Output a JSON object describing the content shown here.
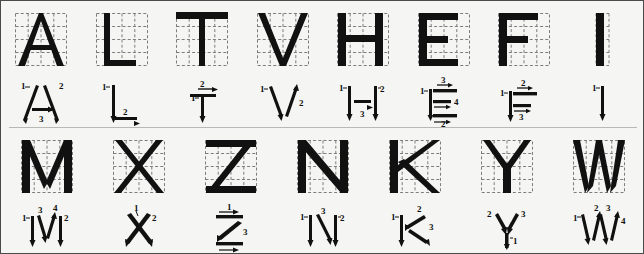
{
  "chart": {
    "background_color": "#f5f5f3",
    "ink_color": "#111111",
    "grid_color": "#7d7d7d",
    "border_color": "#4a4a4a",
    "grid": {
      "rows": 4,
      "cols": 4,
      "style": "dashed"
    },
    "rows": [
      {
        "name": "row-1",
        "cells": [
          {
            "letter": "A",
            "glyph": "A",
            "stroke_count": 3,
            "stroke_labels": [
              "1",
              "2",
              "3"
            ],
            "stroke_notes": "1 left diagonal down, 2 right diagonal down, 3 crossbar left to right"
          },
          {
            "letter": "L",
            "glyph": "L",
            "stroke_count": 2,
            "stroke_labels": [
              "1",
              "2"
            ],
            "stroke_notes": "1 vertical down, 2 horizontal left to right"
          },
          {
            "letter": "T",
            "glyph": "T",
            "stroke_count": 2,
            "stroke_labels": [
              "1",
              "2"
            ],
            "stroke_notes": "1 vertical down, 2 top horizontal left to right"
          },
          {
            "letter": "V",
            "glyph": "V",
            "stroke_count": 2,
            "stroke_labels": [
              "1",
              "2"
            ],
            "stroke_notes": "1 left diagonal down, 2 right diagonal up"
          },
          {
            "letter": "H",
            "glyph": "H",
            "stroke_count": 3,
            "stroke_labels": [
              "1",
              "2",
              "3"
            ],
            "stroke_notes": "1 left vertical down, 2 right vertical down, 3 crossbar left to right"
          },
          {
            "letter": "E",
            "glyph": "E",
            "stroke_count": 4,
            "stroke_labels": [
              "1",
              "2",
              "3",
              "4"
            ],
            "stroke_notes": "1 vertical down, 3 top horizontal, 4 middle horizontal, 2 bottom horizontal"
          },
          {
            "letter": "F",
            "glyph": "F",
            "stroke_count": 3,
            "stroke_labels": [
              "1",
              "2",
              "3"
            ],
            "stroke_notes": "1 vertical down, 2 top horizontal, 3 middle horizontal"
          },
          {
            "letter": "I",
            "glyph": "I",
            "stroke_count": 1,
            "stroke_labels": [
              "1"
            ],
            "stroke_notes": "1 vertical down"
          }
        ]
      },
      {
        "name": "row-2",
        "cells": [
          {
            "letter": "M",
            "glyph": "M",
            "stroke_count": 4,
            "stroke_labels": [
              "1",
              "2",
              "3",
              "4"
            ],
            "stroke_notes": "1 left vertical down, 2 right vertical down, 3 diagonal down, 4 diagonal up"
          },
          {
            "letter": "X",
            "glyph": "X",
            "stroke_count": 2,
            "stroke_labels": [
              "1",
              "2"
            ],
            "stroke_notes": "1 diagonal down-left, 2 diagonal down-right"
          },
          {
            "letter": "Z",
            "glyph": "Z",
            "stroke_count": 3,
            "stroke_labels": [
              "1",
              "2",
              "3"
            ],
            "stroke_notes": "1 top horizontal, 3 diagonal down-left, 2 bottom horizontal"
          },
          {
            "letter": "N",
            "glyph": "N",
            "stroke_count": 3,
            "stroke_labels": [
              "1",
              "2",
              "3"
            ],
            "stroke_notes": "1 left vertical down, 2 right vertical down, 3 diagonal down"
          },
          {
            "letter": "K",
            "glyph": "K",
            "stroke_count": 3,
            "stroke_labels": [
              "1",
              "2",
              "3"
            ],
            "stroke_notes": "1 vertical down, 2 upper diagonal inward, 3 lower diagonal outward"
          },
          {
            "letter": "Y",
            "glyph": "Y",
            "stroke_count": 3,
            "stroke_labels": [
              "1",
              "2",
              "3"
            ],
            "stroke_notes": "1 stem up, 2 left diagonal down, 3 right diagonal down"
          },
          {
            "letter": "W",
            "glyph": "W",
            "stroke_count": 4,
            "stroke_labels": [
              "1",
              "2",
              "3",
              "4"
            ],
            "stroke_notes": "1 diagonal down, 2 diagonal up, 3 diagonal down, 4 diagonal up"
          }
        ]
      }
    ]
  }
}
